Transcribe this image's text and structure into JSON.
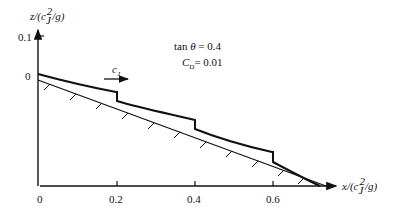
{
  "figure": {
    "y_axis": {
      "label": "z/(c_J^2/g)",
      "ticks": [
        {
          "label": "0.1"
        },
        {
          "label": "0"
        }
      ]
    },
    "x_axis": {
      "label": "x/(c_J^2/g)",
      "ticks": [
        {
          "label": "0"
        },
        {
          "label": "0.2"
        },
        {
          "label": "0.4"
        },
        {
          "label": "0.6"
        }
      ]
    },
    "annotations": {
      "tan_theta": "tan θ = 0.4",
      "drag_coefficient": "C_D= 0.01",
      "velocity_label": "c_J"
    }
  }
}
